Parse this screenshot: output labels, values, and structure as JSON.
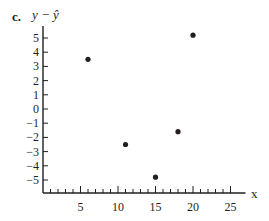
{
  "panel_label": "c.",
  "chart_data": {
    "type": "scatter",
    "title": "",
    "xlabel": "x",
    "ylabel": "y − ŷ",
    "xlim": [
      0,
      27
    ],
    "ylim": [
      -5.8,
      5.8
    ],
    "x_ticks": [
      5,
      10,
      15,
      20,
      25
    ],
    "x_minor_tick_step": 1,
    "y_ticks": [
      -5,
      -4,
      -3,
      -2,
      -1,
      0,
      1,
      2,
      3,
      4,
      5
    ],
    "grid": false,
    "legend": null,
    "points": [
      {
        "x": 6,
        "y": 3.5
      },
      {
        "x": 11,
        "y": -2.5
      },
      {
        "x": 15,
        "y": -4.8
      },
      {
        "x": 18,
        "y": -1.6
      },
      {
        "x": 20,
        "y": 5.2
      }
    ],
    "marker_color": "#231f20"
  }
}
